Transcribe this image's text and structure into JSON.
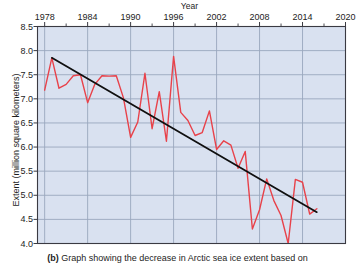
{
  "chart_data": {
    "type": "line",
    "title": "",
    "xlabel": "Year",
    "ylabel": "Extent (million square kilometers)",
    "xlim": [
      1977,
      2020
    ],
    "ylim": [
      4.0,
      8.5
    ],
    "grid": true,
    "legend_position": "none",
    "x_ticks": [
      1978,
      1984,
      1990,
      1996,
      2002,
      2008,
      2014,
      2020
    ],
    "x_tick_labels": [
      "1978",
      "1984",
      "1990",
      "1996",
      "2002",
      "2008",
      "2014",
      "2020"
    ],
    "x_minor_tick_interval": 3,
    "y_ticks": [
      4.0,
      4.5,
      5.0,
      5.5,
      6.0,
      6.5,
      7.0,
      7.5,
      8.0,
      8.5
    ],
    "y_tick_labels": [
      "4.0",
      "4.5",
      "5.0",
      "5.5",
      "6.0",
      "6.5",
      "7.0",
      "7.5",
      "8.0",
      "8.5"
    ],
    "series": [
      {
        "name": "Arctic sea ice extent",
        "color": "#e8424a",
        "type": "line",
        "x": [
          1978,
          1979,
          1980,
          1981,
          1982,
          1983,
          1984,
          1985,
          1986,
          1987,
          1988,
          1989,
          1990,
          1991,
          1992,
          1993,
          1994,
          1995,
          1996,
          1997,
          1998,
          1999,
          2000,
          2001,
          2002,
          2003,
          2004,
          2005,
          2006,
          2007,
          2008,
          2009,
          2010,
          2011,
          2012,
          2013,
          2014,
          2015,
          2016
        ],
        "values": [
          7.18,
          7.85,
          7.22,
          7.3,
          7.48,
          7.5,
          6.92,
          7.3,
          7.48,
          7.47,
          7.48,
          7.02,
          6.2,
          6.52,
          7.53,
          6.38,
          7.15,
          6.12,
          7.88,
          6.72,
          6.55,
          6.24,
          6.3,
          6.75,
          5.95,
          6.13,
          6.04,
          5.56,
          5.91,
          4.3,
          4.7,
          5.34,
          4.89,
          4.58,
          4.0,
          5.33,
          5.27,
          4.61,
          4.72
        ]
      },
      {
        "name": "Linear trend",
        "color": "#101010",
        "type": "line",
        "x": [
          1979,
          2016
        ],
        "values": [
          7.85,
          4.65
        ]
      }
    ]
  },
  "caption": {
    "label": "(b)",
    "text": "Graph showing the decrease in Arctic sea ice extent based on"
  },
  "style": {
    "plot_background": "#d9e1f0",
    "grid_color": "#9aa7bd",
    "axis_color": "#3a3a42",
    "page_background": "#ffffff"
  }
}
